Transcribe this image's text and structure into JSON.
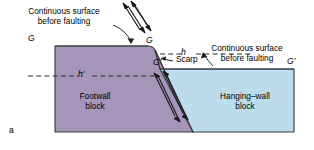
{
  "figure": {
    "panel_label": "a",
    "caption_topic": "normal-fault block diagram"
  },
  "colors": {
    "footwall_fill": "#a396b9",
    "hangingwall_fill": "#bcdcee",
    "outline": "#3a3a3a",
    "text": "#000000",
    "dashed": "#2b2b34",
    "background": "#ffffff"
  },
  "annotations": {
    "left_surface_note": {
      "line1": "Continuous surface",
      "line2": "before faulting"
    },
    "right_surface_note": {
      "line1": "Continuous surface",
      "line2": "before faulting"
    },
    "scarp_label": "Scarp",
    "throw_label": "h",
    "heave_label": "h′"
  },
  "markers": {
    "g_left": "G",
    "g_mid_upper": "G",
    "g_mid_lower": "G′",
    "g_right": "G′"
  },
  "blocks": {
    "footwall": {
      "line1": "Footwall",
      "line2": "block"
    },
    "hangingwall": {
      "line1": "Hanging–wall",
      "line2": "block"
    }
  }
}
